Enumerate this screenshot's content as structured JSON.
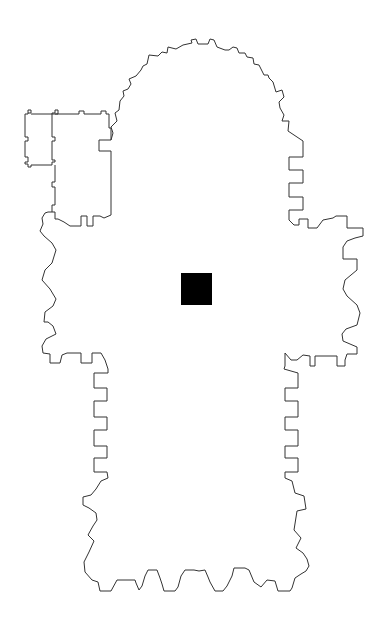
{
  "diagram": {
    "type": "architectural-floor-plan",
    "colors": {
      "background": "#ffffff",
      "outline": "#333333",
      "marker": "#000000"
    },
    "marker": {
      "x": 181,
      "y": 273,
      "width": 31,
      "height": 32
    }
  }
}
